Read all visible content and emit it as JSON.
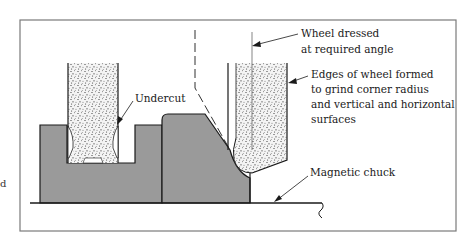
{
  "figure": {
    "labels": {
      "wheel_dressed_line1": "Wheel dressed",
      "wheel_dressed_line2": "at required angle",
      "edges_line1": "Edges of wheel formed",
      "edges_line2": "to grind corner radius",
      "edges_line3": "and vertical and horizontal",
      "edges_line4": "surfaces",
      "undercut": "Undercut",
      "magnetic_chuck": "Magnetic chuck"
    },
    "margin_fragment": "d",
    "colors": {
      "workpiece_fill": "#9a9a9a",
      "outline": "#1a1a1a",
      "frame": "#7a7a7a",
      "wheel_fill": "#f2f2f2",
      "grit": "#222222"
    }
  }
}
